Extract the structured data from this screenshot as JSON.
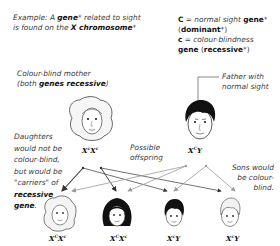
{
  "header": {
    "example_line1_pre": "Example: A ",
    "example_line1_bold": "gene",
    "example_line1_post": "* related to sight",
    "example_line2_pre": "is found on the ",
    "example_line2_bold": "X chromosome",
    "example_line2_post": "*"
  },
  "key": {
    "dominant_symbol": "C",
    "dominant_desc": " = normal sight ",
    "dominant_gene": "gene",
    "dominant_star": "*",
    "dominant_open": "(",
    "dominant_term": "dominant",
    "dominant_close": "*)",
    "recessive_symbol": "c",
    "recessive_desc": " = colour-blindness",
    "recessive_gene": "gene",
    "recessive_open": " (",
    "recessive_term": "recessive",
    "recessive_close": "*)"
  },
  "mother": {
    "caption_line1": "Colour-blind mother",
    "caption_line2_pre": "(both ",
    "caption_line2_bold": "genes recessive",
    "caption_line2_post": ")",
    "genotype_base1": "X",
    "genotype_sup1": "c",
    "genotype_base2": "X",
    "genotype_sup2": "c"
  },
  "father": {
    "caption_line1": "Father with",
    "caption_line2": "normal sight",
    "genotype_base1": "X",
    "genotype_sup1": "C",
    "genotype_base2": "Y"
  },
  "offspring_label": {
    "line1": "Possible",
    "line2": "offspring"
  },
  "daughters_note": {
    "line1": "Daughters",
    "line2": "would not be",
    "line3": "colour-blind,",
    "line4": "but would be",
    "line5": "\"carriers\" of",
    "line6_bold": "recessive",
    "line7_bold": "gene",
    "line7_post": "."
  },
  "sons_note": {
    "line1": "Sons would",
    "line2": "be colour-",
    "line3": "blind."
  },
  "children": [
    {
      "sex": "daughter",
      "hair": "light",
      "base1": "X",
      "sup1": "C",
      "base2": "X",
      "sup2": "c"
    },
    {
      "sex": "daughter",
      "hair": "dark",
      "base1": "X",
      "sup1": "C",
      "base2": "X",
      "sup2": "c"
    },
    {
      "sex": "son",
      "hair": "dark",
      "base1": "X",
      "sup1": "c",
      "base2": "Y",
      "sup2": ""
    },
    {
      "sex": "son",
      "hair": "light",
      "base1": "X",
      "sup1": "c",
      "base2": "Y",
      "sup2": ""
    }
  ],
  "colors": {
    "mother_arrow": "#333333",
    "father_arrow": "#9a9a9a",
    "dark_hair": "#111111",
    "light_hair": "#f2f2f2"
  }
}
